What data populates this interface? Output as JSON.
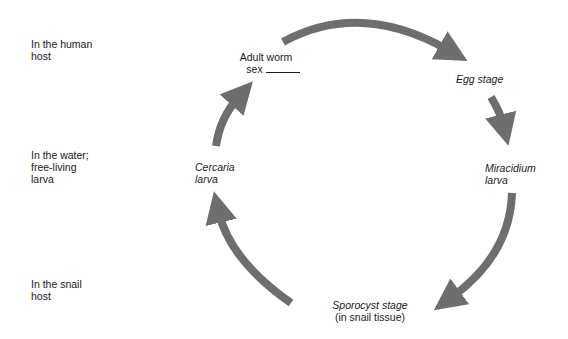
{
  "zones": [
    {
      "line1": "In the human",
      "line2": "host"
    },
    {
      "line1": "In the water;",
      "line2": "free-living",
      "line3": "larva"
    },
    {
      "line1": "In the snail",
      "line2": "host"
    }
  ],
  "stages": {
    "adult": {
      "line1": "Adult worm",
      "line2": "sex"
    },
    "egg": {
      "line1": "Egg stage"
    },
    "miracidium": {
      "line1": "Miracidium",
      "line2": "larva"
    },
    "sporocyst": {
      "line1": "Sporocyst stage",
      "line2": "(in snail tissue)"
    },
    "cercaria": {
      "line1": "Cercaria",
      "line2": "larva"
    }
  },
  "colors": {
    "arrow": "#6e6e6e",
    "text": "#1a1a1a",
    "background": "#ffffff"
  }
}
